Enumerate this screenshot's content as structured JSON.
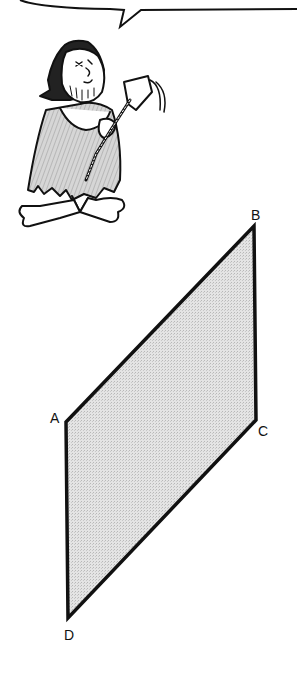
{
  "figure": {
    "speech_bubble": {
      "text": ""
    },
    "character": {
      "description": "caveman holding a measuring tape"
    },
    "shape": {
      "type": "parallelogram",
      "fill": "#d9d9d9",
      "stroke": "#111111",
      "vertices": [
        {
          "label": "A",
          "x": 66,
          "y": 422
        },
        {
          "label": "B",
          "x": 254,
          "y": 226
        },
        {
          "label": "C",
          "x": 256,
          "y": 420
        },
        {
          "label": "D",
          "x": 68,
          "y": 618
        }
      ]
    },
    "labels": {
      "A": "A",
      "B": "B",
      "C": "C",
      "D": "D"
    }
  }
}
